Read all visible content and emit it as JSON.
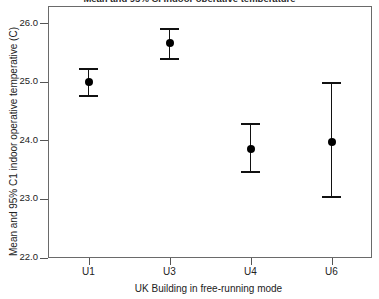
{
  "chart_data": {
    "type": "scatter",
    "title": "Mean and 95% CI indoor operative temperature",
    "xlabel": "UK Building in free-running mode",
    "ylabel": "Mean and 95% C1 indoor operative temperative (C)",
    "categories": [
      "U1",
      "U3",
      "U4",
      "U6"
    ],
    "values": [
      25.0,
      25.67,
      23.86,
      23.98
    ],
    "ci_lower": [
      24.76,
      25.4,
      23.46,
      23.04
    ],
    "ci_upper": [
      25.22,
      25.9,
      24.28,
      24.98
    ],
    "ylim": [
      22.0,
      26.3
    ],
    "yticks": [
      26.0,
      25.0,
      24.0,
      23.0,
      22.0
    ],
    "ytick_labels": [
      "26.0",
      "25.0",
      "24.0",
      "23.0",
      "22.0"
    ],
    "grid": false,
    "legend": "none",
    "marker_color": "#000000",
    "errorbar_color": "#111111",
    "frame_color": "#6a6a6a"
  },
  "axes": {
    "y_title": "Mean and 95% C1 indoor operative temperative (C)",
    "x_title": "UK Building in free-running mode",
    "y_labels": [
      "26.0",
      "25.0",
      "24.0",
      "23.0",
      "22.0"
    ],
    "x_labels": [
      "U1",
      "U3",
      "U4",
      "U6"
    ]
  },
  "header": {
    "title": "Mean and 95% CI indoor operative temperature"
  }
}
